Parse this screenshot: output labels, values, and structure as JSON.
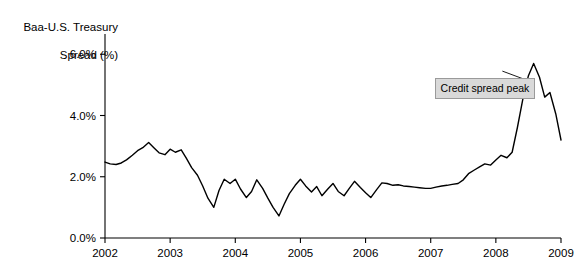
{
  "chart_data": {
    "type": "line",
    "title": "",
    "ylabel": "Baa-U.S. Treasury Spread (%)",
    "xlabel": "",
    "ylim": [
      0,
      6.4
    ],
    "xlim": [
      2002.0,
      2009.0
    ],
    "grid": false,
    "legend": "none",
    "y_ticks": [
      "0.0%",
      "2.0%",
      "4.0%",
      "6.0%"
    ],
    "y_tick_values": [
      0,
      2,
      4,
      6
    ],
    "x_ticks": [
      "2002",
      "2003",
      "2004",
      "2005",
      "2006",
      "2007",
      "2008",
      "2009"
    ],
    "x_tick_values": [
      2002,
      2003,
      2004,
      2005,
      2006,
      2007,
      2008,
      2009
    ],
    "annotations": [
      {
        "text": "Credit spread peak",
        "x": 2007.55,
        "y": 5.0
      }
    ],
    "series": [
      {
        "name": "Baa-U.S. Treasury Spread",
        "x": [
          2002.0,
          2002.08,
          2002.17,
          2002.25,
          2002.33,
          2002.42,
          2002.5,
          2002.58,
          2002.67,
          2002.75,
          2002.83,
          2002.92,
          2003.0,
          2003.08,
          2003.17,
          2003.25,
          2003.33,
          2003.42,
          2003.5,
          2003.58,
          2003.67,
          2003.75,
          2003.83,
          2003.92,
          2004.0,
          2004.08,
          2004.17,
          2004.25,
          2004.33,
          2004.42,
          2004.5,
          2004.58,
          2004.67,
          2004.75,
          2004.83,
          2004.92,
          2005.0,
          2005.08,
          2005.17,
          2005.25,
          2005.33,
          2005.42,
          2005.5,
          2005.58,
          2005.67,
          2005.75,
          2005.83,
          2005.92,
          2006.0,
          2006.08,
          2006.17,
          2006.25,
          2006.33,
          2006.42,
          2006.5,
          2006.58,
          2006.67,
          2006.75,
          2006.83,
          2006.92,
          2007.0,
          2007.08,
          2007.17,
          2007.25,
          2007.33,
          2007.42,
          2007.5,
          2007.58,
          2007.67,
          2007.75,
          2007.83,
          2007.92,
          2008.0,
          2008.08,
          2008.17,
          2008.25,
          2008.33,
          2008.42,
          2008.5,
          2008.58,
          2008.67,
          2008.75,
          2008.83,
          2008.92,
          2009.0
        ],
        "y": [
          2.48,
          2.42,
          2.4,
          2.45,
          2.55,
          2.7,
          2.85,
          2.95,
          3.12,
          2.95,
          2.78,
          2.72,
          2.9,
          2.8,
          2.88,
          2.6,
          2.3,
          2.05,
          1.7,
          1.3,
          1.0,
          1.55,
          1.92,
          1.78,
          1.92,
          1.6,
          1.32,
          1.52,
          1.9,
          1.62,
          1.3,
          1.0,
          0.72,
          1.1,
          1.45,
          1.72,
          1.92,
          1.7,
          1.5,
          1.68,
          1.38,
          1.6,
          1.78,
          1.52,
          1.38,
          1.62,
          1.85,
          1.65,
          1.48,
          1.32,
          1.58,
          1.8,
          1.78,
          1.72,
          1.74,
          1.7,
          1.68,
          1.66,
          1.64,
          1.62,
          1.62,
          1.66,
          1.7,
          1.72,
          1.75,
          1.78,
          1.9,
          2.1,
          2.22,
          2.32,
          2.42,
          2.38,
          2.55,
          2.7,
          2.62,
          2.8,
          3.6,
          4.6,
          5.3,
          5.7,
          5.25,
          4.6,
          4.75,
          4.05,
          3.2
        ]
      }
    ]
  },
  "axis": {
    "y_title_line1": "Baa-U.S. Treasury",
    "y_title_line2": "Spread (%)"
  }
}
